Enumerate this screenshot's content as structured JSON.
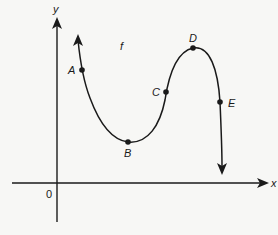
{
  "diagram": {
    "function_label": "f",
    "axes": {
      "x_label": "x",
      "y_label": "y",
      "origin_label": "0"
    },
    "points": [
      {
        "name": "A",
        "x": 82,
        "y": 70,
        "label_dx": -14,
        "label_dy": 4
      },
      {
        "name": "B",
        "x": 128,
        "y": 142,
        "label_dx": -4,
        "label_dy": 15
      },
      {
        "name": "C",
        "x": 166,
        "y": 92,
        "label_dx": -14,
        "label_dy": 4
      },
      {
        "name": "D",
        "x": 193,
        "y": 48,
        "label_dx": -4,
        "label_dy": -6
      },
      {
        "name": "E",
        "x": 220,
        "y": 102,
        "label_dx": 8,
        "label_dy": 5
      }
    ],
    "colors": {
      "ink": "#1a1a1a",
      "background": "#f7f7f5"
    }
  }
}
